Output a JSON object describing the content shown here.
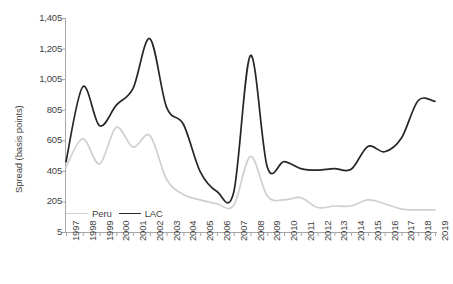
{
  "chart_data": {
    "type": "line",
    "title": "",
    "xlabel": "",
    "ylabel": "Spread (basis points)",
    "grid": false,
    "legend_position": "bottom-left-inside",
    "xlim": [
      1997,
      2019
    ],
    "ylim": [
      5,
      1405
    ],
    "yticks": [
      "5",
      "205",
      "405",
      "605",
      "805",
      "1,005",
      "1,205",
      "1,405"
    ],
    "ytick_values": [
      5,
      205,
      405,
      605,
      805,
      1005,
      1205,
      1405
    ],
    "categories": [
      "1997",
      "1998",
      "1999",
      "2000",
      "2001",
      "2002",
      "2003",
      "2004",
      "2005",
      "2006",
      "2007",
      "2008",
      "2009",
      "2010",
      "2011",
      "2012",
      "2013",
      "2014",
      "2015",
      "2016",
      "2017",
      "2018",
      "2019"
    ],
    "series": [
      {
        "name": "Peru",
        "color": "#cfcfcf",
        "values": [
          430,
          615,
          450,
          690,
          560,
          635,
          350,
          250,
          215,
          190,
          180,
          500,
          240,
          215,
          230,
          165,
          175,
          175,
          215,
          190,
          155,
          150,
          150
        ]
      },
      {
        "name": "LAC",
        "color": "#262626",
        "values": [
          465,
          955,
          700,
          835,
          945,
          1270,
          820,
          710,
          400,
          270,
          265,
          1160,
          430,
          465,
          420,
          410,
          420,
          415,
          565,
          530,
          620,
          865,
          860
        ]
      }
    ]
  },
  "legend": {
    "items": [
      {
        "label": "Peru",
        "color": "#cfcfcf"
      },
      {
        "label": "LAC",
        "color": "#262626"
      }
    ]
  },
  "axes": {
    "y_title": "Spread (basis points)"
  },
  "caption": {
    "text": ""
  }
}
